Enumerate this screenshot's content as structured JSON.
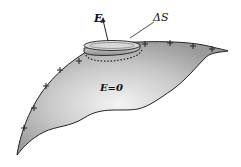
{
  "figure": {
    "type": "physics-diagram",
    "labels": {
      "field_vector": "E",
      "pillbox_area": "ΔS",
      "interior_field": "E=0"
    },
    "surface_charge_symbol": "+",
    "plus_marks": [
      {
        "x": 24,
        "y": 128
      },
      {
        "x": 34,
        "y": 108
      },
      {
        "x": 46,
        "y": 86
      },
      {
        "x": 60,
        "y": 70
      },
      {
        "x": 79,
        "y": 61
      },
      {
        "x": 145,
        "y": 44
      },
      {
        "x": 170,
        "y": 43
      },
      {
        "x": 193,
        "y": 46
      },
      {
        "x": 212,
        "y": 49
      }
    ],
    "colors": {
      "outline": "#222222",
      "fill_light": "#f2f2f2",
      "fill_dark": "#a8a8a8",
      "background": "#ffffff"
    }
  }
}
